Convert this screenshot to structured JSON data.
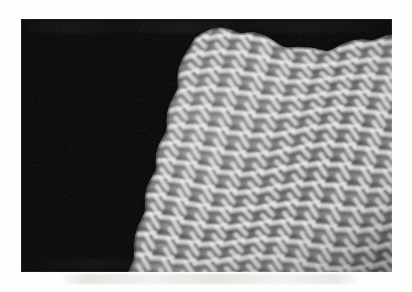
{
  "document": {
    "kind": "scanned-figure-plate",
    "page_background": "#fefefe",
    "caption": "",
    "ghost_text_artifact": true
  },
  "figure": {
    "name": "stm-surface-topograph",
    "plate": {
      "x": 21,
      "y": 19,
      "width": 371,
      "height": 253,
      "background_color": "#040404"
    },
    "render_style": "shaded-3d-perspective-surface",
    "colormap": "grayscale",
    "illumination": {
      "azimuth_deg": 315,
      "elevation_deg": 38
    },
    "tone": {
      "background": "#040404",
      "surface_mid": "#8a8a8a",
      "ridge_highlight": "#f2f2f2",
      "trough_shadow": "#2e2e2e",
      "specular": "#ffffff"
    }
  },
  "chart_data": {
    "type": "heatmap",
    "title": "",
    "subtitle": "",
    "xlabel": "",
    "ylabel": "",
    "zlabel": "",
    "legend": [],
    "annotations": [],
    "grid": false,
    "render": "3d-surface-shaded-relief",
    "projection": {
      "kind": "oblique-perspective",
      "view_azimuth_deg": 322,
      "view_elevation_deg": 34,
      "z_exaggeration": 2.4
    },
    "lattice": {
      "motif": "herringbone-zigzag-ridges",
      "ridge_period_x_px": 22,
      "ridge_period_y_px": 17,
      "row_shear_px": 9,
      "ridge_width_px": 4,
      "columns": 17,
      "rows": 13
    },
    "surface_extent_px": {
      "left": 24,
      "top": 27,
      "right": 355,
      "bottom": 237
    },
    "corrugation": {
      "primary_amplitude_px": 11,
      "secondary_amplitude_px": 5,
      "edge_scallop_period_px": 36
    },
    "x": [
      0,
      1,
      2,
      3,
      4,
      5,
      6,
      7,
      8,
      9,
      10,
      11,
      12,
      13,
      14,
      15,
      16
    ],
    "y": [
      0,
      1,
      2,
      3,
      4,
      5,
      6,
      7,
      8,
      9,
      10,
      11,
      12
    ],
    "z_range": [
      0.0,
      1.0
    ],
    "values_note": "Periodic zigzag corrugation; z = sum of two shear-coupled sinusoids forming connected chevron ridges.",
    "series": [
      {
        "name": "ridge-crest",
        "level": 1.0
      },
      {
        "name": "terrace",
        "level": 0.45
      },
      {
        "name": "trough",
        "level": 0.0
      }
    ]
  }
}
